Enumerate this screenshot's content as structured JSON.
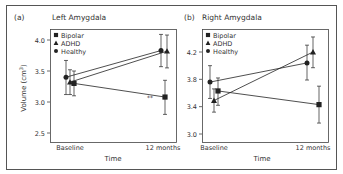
{
  "figure": {
    "frame_color": "#555555",
    "line_color": "#222222",
    "text_color": "#333333"
  },
  "chart_data": [
    {
      "type": "line",
      "panel_label": "(a)",
      "title": "Left Amygdala",
      "xlabel": "Time",
      "ylabel": "Volume (cm³)",
      "ylabel_base": "Volume (cm",
      "ylabel_sup": "3",
      "ylabel_end": ")",
      "categories": [
        "Baseline",
        "12 months"
      ],
      "ylim": [
        2.5,
        4.0
      ],
      "yticks": [
        "4.0",
        "3.5",
        "3.0",
        "2.5"
      ],
      "ytick_values": [
        4.0,
        3.5,
        3.0,
        2.5
      ],
      "grid": false,
      "legend_position": "upper left",
      "annotation": "**",
      "series": [
        {
          "name": "Bipolar",
          "marker": "square",
          "values": [
            3.3,
            3.08
          ],
          "err_low": [
            3.1,
            2.8
          ],
          "err_high": [
            3.5,
            3.35
          ]
        },
        {
          "name": "ADHD",
          "marker": "triangle",
          "values": [
            3.32,
            3.82
          ],
          "err_low": [
            3.12,
            3.55
          ],
          "err_high": [
            3.52,
            4.08
          ]
        },
        {
          "name": "Healthy",
          "marker": "circle",
          "values": [
            3.4,
            3.83
          ],
          "err_low": [
            3.12,
            3.57
          ],
          "err_high": [
            3.67,
            4.09
          ]
        }
      ]
    },
    {
      "type": "line",
      "panel_label": "(b)",
      "title": "Right Amygdala",
      "xlabel": "Time",
      "ylabel": "",
      "categories": [
        "Baseline",
        "12 months"
      ],
      "ylim": [
        3.0,
        4.2
      ],
      "yticks": [
        "4.2",
        "3.8",
        "3.4",
        "3.0"
      ],
      "ytick_values": [
        4.2,
        3.8,
        3.4,
        3.0
      ],
      "grid": false,
      "legend_position": "upper left",
      "series": [
        {
          "name": "Bipolar",
          "marker": "square",
          "values": [
            3.63,
            3.43
          ],
          "err_low": [
            3.42,
            3.16
          ],
          "err_high": [
            3.82,
            3.7
          ]
        },
        {
          "name": "ADHD",
          "marker": "triangle",
          "values": [
            3.49,
            4.2
          ],
          "err_low": [
            3.32,
            3.97
          ],
          "err_high": [
            3.66,
            4.42
          ]
        },
        {
          "name": "Healthy",
          "marker": "circle",
          "values": [
            3.76,
            4.04
          ],
          "err_low": [
            3.52,
            3.79
          ],
          "err_high": [
            4.0,
            4.3
          ]
        }
      ]
    }
  ]
}
